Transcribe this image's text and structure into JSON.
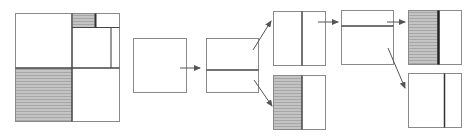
{
  "diagram": {
    "type": "space-partitioning-tree",
    "colors": {
      "background": "#ffffff",
      "border": "#8a8a8a",
      "split_line": "#444444",
      "shade": "#b8b8b8",
      "arrow": "#555555"
    },
    "overview": {
      "label": "",
      "description": "Full partition of the square into regions"
    },
    "steps": [
      {
        "id": "root",
        "split": "none"
      },
      {
        "id": "level1",
        "split": "horizontal"
      },
      {
        "id": "level2-top",
        "split": "vertical"
      },
      {
        "id": "level2-bottom",
        "split": "vertical",
        "shaded": "left"
      },
      {
        "id": "level3",
        "split": "horizontal"
      },
      {
        "id": "level4-top",
        "split": "vertical",
        "shaded": "left"
      },
      {
        "id": "level4-bottom",
        "split": "vertical"
      }
    ]
  }
}
